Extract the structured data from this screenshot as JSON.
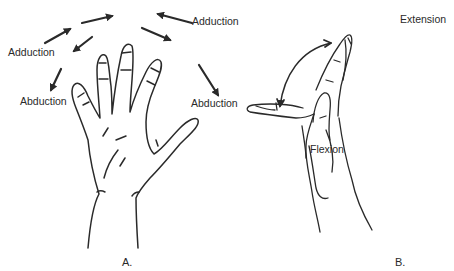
{
  "figure": {
    "panels": [
      {
        "id": "A",
        "label": "A.",
        "motions": {
          "adduction_left": "Adduction",
          "adduction_right": "Adduction",
          "abduction_left": "Abduction",
          "abduction_right": "Abduction"
        }
      },
      {
        "id": "B",
        "label": "B.",
        "motions": {
          "extension": "Extension",
          "flexion": "Flexion"
        }
      }
    ],
    "colors": {
      "ink": "#2a2a2a",
      "background": "#ffffff"
    }
  }
}
